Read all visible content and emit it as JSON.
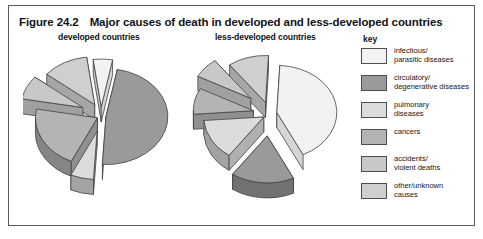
{
  "figure": {
    "number": "Figure 24.2",
    "title": "Major causes of death in developed and less-developed countries"
  },
  "panels": {
    "developed_title": "developed countries",
    "lessdev_title": "less-developed countries"
  },
  "key": {
    "title": "key",
    "items": [
      {
        "label": "infectious/\nparasitic diseases",
        "color": "#f2f2f0"
      },
      {
        "label": "circulatory/\ndegenerative diseases",
        "color": "#9a9a98"
      },
      {
        "label": "pulmonary\ndiseases",
        "color": "#dcdcda"
      },
      {
        "label": "cancers",
        "color": "#b4b4b2"
      },
      {
        "label": "accidents/\nviolent deaths",
        "color": "#c8c8c6"
      },
      {
        "label": "other/unknown\ncauses",
        "color": "#cfcfcd"
      }
    ]
  },
  "chart_data": [
    {
      "type": "pie",
      "title": "developed countries",
      "exploded": true,
      "three_d": true,
      "categories": [
        "infectious/parasitic diseases",
        "circulatory/degenerative diseases",
        "pulmonary diseases",
        "cancers",
        "accidents/violent deaths",
        "other/unknown causes"
      ],
      "values": [
        5,
        48,
        6,
        21,
        8,
        12
      ],
      "colors": [
        "#f2f2f0",
        "#9a9a98",
        "#dcdcda",
        "#b4b4b2",
        "#c8c8c6",
        "#cfcfcd"
      ]
    },
    {
      "type": "pie",
      "title": "less-developed countries",
      "exploded": true,
      "three_d": true,
      "categories": [
        "infectious/parasitic diseases",
        "circulatory/degenerative diseases",
        "pulmonary diseases",
        "cancers",
        "accidents/violent deaths",
        "other/unknown causes"
      ],
      "values": [
        42,
        17,
        14,
        9,
        7,
        11
      ],
      "colors": [
        "#f2f2f0",
        "#9a9a98",
        "#dcdcda",
        "#b4b4b2",
        "#c8c8c6",
        "#cfcfcd"
      ]
    }
  ]
}
